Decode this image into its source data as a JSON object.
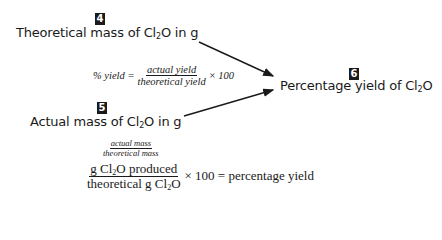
{
  "steps": [
    {
      "number": "4",
      "label_pre": "Theoretical mass of Cl",
      "label_sub": "2",
      "label_post": "O in g"
    },
    {
      "number": "5",
      "label_pre": "Actual mass of Cl",
      "label_sub": "2",
      "label_post": "O in g"
    },
    {
      "number": "6",
      "label_pre": "Percentage yield of Cl",
      "label_sub": "2",
      "label_post": "O"
    }
  ],
  "formula_general": {
    "lhs": "% yield =",
    "numerator": "actual yield",
    "denominator": "theoretical yield",
    "rhs": "× 100"
  },
  "formula_specific": {
    "annotation_numerator": "actual mass",
    "annotation_denominator": "theoretical mass",
    "numerator_pre": "g Cl",
    "numerator_sub": "2",
    "numerator_post": "O produced",
    "denominator_pre": "theoretical g Cl",
    "denominator_sub": "2",
    "denominator_post": "O",
    "rhs": "× 100 = percentage yield"
  }
}
